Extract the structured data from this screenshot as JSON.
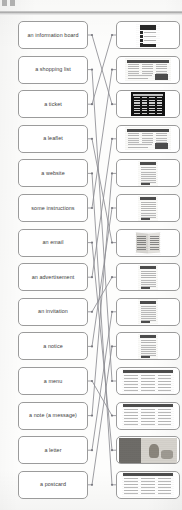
{
  "page": {
    "type": "matching-exercise-worksheet",
    "corner_mark": "ii",
    "has_header_rule": true,
    "line_color": "#8d8d92",
    "box_border_color": "#9b9b9b",
    "text_color": "#3c3c3c",
    "background_color": "#fdfdfc"
  },
  "left_column": {
    "name": "text-labels",
    "items": [
      {
        "id": "l1",
        "label": "an information board"
      },
      {
        "id": "l2",
        "label": "a shopping list"
      },
      {
        "id": "l3",
        "label": "a ticket"
      },
      {
        "id": "l4",
        "label": "a leaflet"
      },
      {
        "id": "l5",
        "label": "a website"
      },
      {
        "id": "l6",
        "label": "some instructions"
      },
      {
        "id": "l7",
        "label": "an email"
      },
      {
        "id": "l8",
        "label": "an advertisement"
      },
      {
        "id": "l9",
        "label": "an invitation"
      },
      {
        "id": "l10",
        "label": "a notice"
      },
      {
        "id": "l11",
        "label": "a menu"
      },
      {
        "id": "l12",
        "label": "a note (a message)"
      },
      {
        "id": "l13",
        "label": "a letter"
      },
      {
        "id": "l14",
        "label": "a postcard"
      }
    ]
  },
  "right_column": {
    "name": "image-thumbnails",
    "items": [
      {
        "id": "r1",
        "art": "t-web",
        "caption": "webpage screenshot with dark header and text blocks"
      },
      {
        "id": "r2",
        "art": "t-wide",
        "caption": "wide printed page with columns and small photo"
      },
      {
        "id": "r3",
        "art": "t-dark",
        "caption": "dark departure board with light text rows"
      },
      {
        "id": "r4",
        "art": "t-wide",
        "caption": "wide advertisement page with dark banner"
      },
      {
        "id": "r5",
        "art": "t-tall",
        "caption": "tall illustrated leaflet with figure"
      },
      {
        "id": "r6",
        "art": "t-tall",
        "caption": "tall printed notice sheet"
      },
      {
        "id": "r7",
        "art": "t-leaf",
        "caption": "open folded leaflet, two pages"
      },
      {
        "id": "r8",
        "art": "t-tall",
        "caption": "light card with blue panel and text"
      },
      {
        "id": "r9",
        "art": "t-tall",
        "caption": "dense text document page"
      },
      {
        "id": "r10",
        "art": "t-tall",
        "caption": "dark newspaper style page with photo"
      },
      {
        "id": "r11",
        "art": "t-form",
        "caption": "table of rows with dark header bar"
      },
      {
        "id": "r12",
        "art": "t-form",
        "caption": "menu sheet with three text columns"
      },
      {
        "id": "r13",
        "art": "t-photo",
        "caption": "greyscale photograph postcard"
      },
      {
        "id": "r14",
        "art": "t-form",
        "caption": "email client window with message list"
      }
    ]
  },
  "connections": [
    {
      "from": "l1",
      "to": "r3"
    },
    {
      "from": "l2",
      "to": "r11"
    },
    {
      "from": "l3",
      "to": "r1"
    },
    {
      "from": "l4",
      "to": "r7"
    },
    {
      "from": "l5",
      "to": "r14"
    },
    {
      "from": "l6",
      "to": "r2"
    },
    {
      "from": "l7",
      "to": "r13"
    },
    {
      "from": "l8",
      "to": "r4"
    },
    {
      "from": "l9",
      "to": "r8"
    },
    {
      "from": "l10",
      "to": "r6"
    },
    {
      "from": "l11",
      "to": "r12"
    },
    {
      "from": "l12",
      "to": "r5"
    },
    {
      "from": "l13",
      "to": "r9"
    },
    {
      "from": "l14",
      "to": "r10"
    }
  ]
}
